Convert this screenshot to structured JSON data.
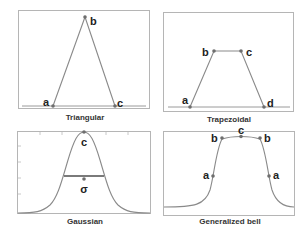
{
  "panels": [
    {
      "id": "triangular",
      "caption": "Triangular",
      "points": [
        {
          "label": "a",
          "x": 53,
          "y": 106
        },
        {
          "label": "b",
          "x": 85,
          "y": 17
        },
        {
          "label": "c",
          "x": 115,
          "y": 106
        }
      ]
    },
    {
      "id": "trapezoidal",
      "caption": "Trapezoidal",
      "points": [
        {
          "label": "a",
          "x": 190,
          "y": 107
        },
        {
          "label": "b",
          "x": 214,
          "y": 51
        },
        {
          "label": "c",
          "x": 241,
          "y": 51
        },
        {
          "label": "d",
          "x": 264,
          "y": 107
        }
      ]
    },
    {
      "id": "gaussian",
      "caption": "Gaussian",
      "labels": {
        "center": "c",
        "width": "σ"
      }
    },
    {
      "id": "generalized-bell",
      "caption": "Generalized bell",
      "labels": {
        "a_left": "a",
        "a_right": "a",
        "b_left": "b",
        "b_right": "b",
        "c": "c"
      }
    }
  ],
  "colors": {
    "curve": "#8a8a8a",
    "point": "#6e6e6e",
    "frame": "#b5b5b5",
    "label": "#222222"
  }
}
